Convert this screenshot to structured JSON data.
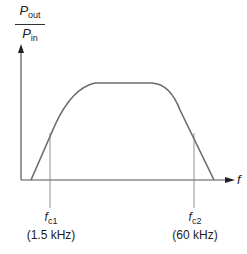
{
  "diagram": {
    "y_axis": {
      "numerator": {
        "symbol": "P",
        "subscript": "out"
      },
      "denominator": {
        "symbol": "P",
        "subscript": "in"
      }
    },
    "x_axis": {
      "label": "f"
    },
    "cutoffs": [
      {
        "symbol": "f",
        "subscript": "c1",
        "value": "(1.5 kHz)"
      },
      {
        "symbol": "f",
        "subscript": "c2",
        "value": "(60 kHz)"
      }
    ],
    "colors": {
      "curve": "#6b6b6b",
      "axis": "#555555",
      "marker": "#777777"
    }
  }
}
